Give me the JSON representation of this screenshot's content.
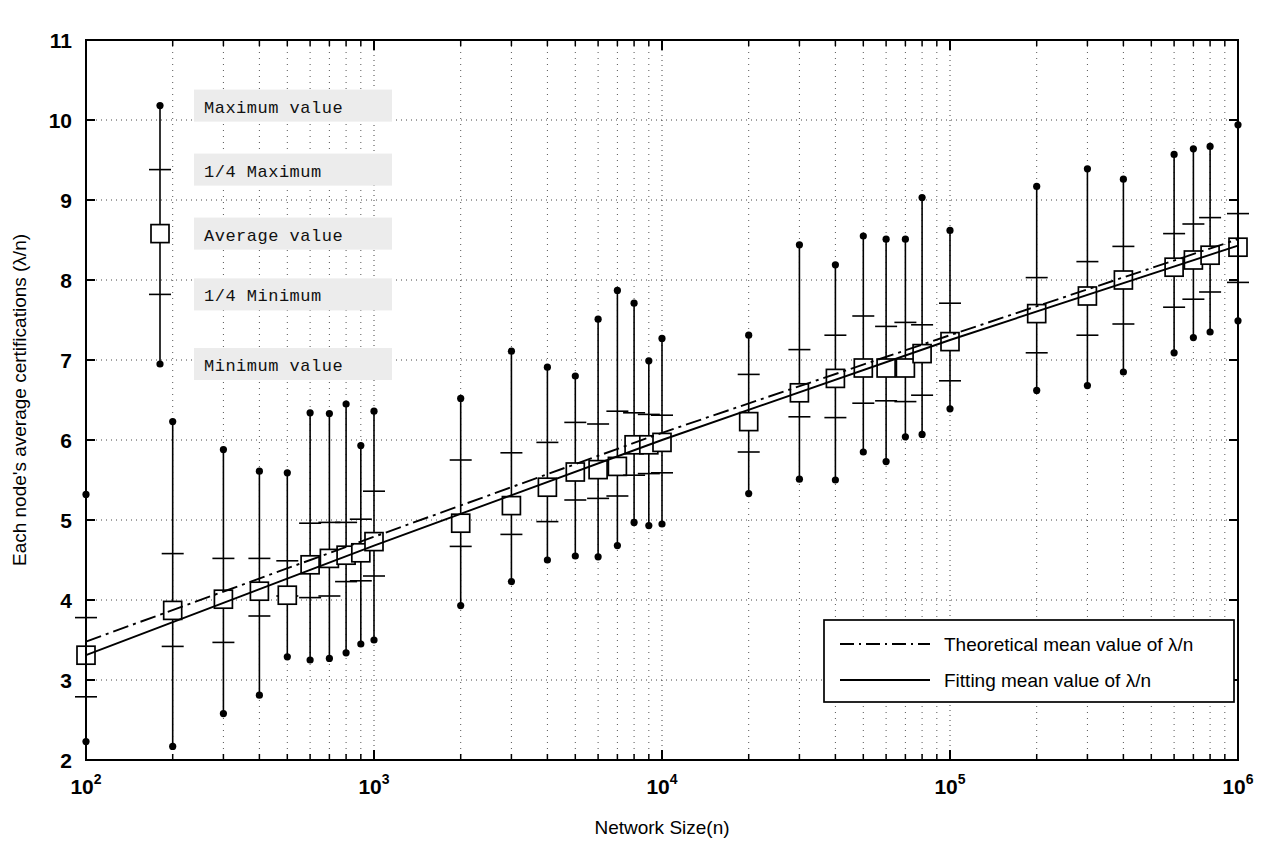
{
  "figure": {
    "title": "",
    "x_axis_label": "Network Size(n)",
    "y_axis_label": "Each node's average certifications (λ/n)"
  },
  "sample_legend": {
    "items": [
      {
        "key": "max",
        "label": "Maximum value",
        "marker": "filled-dot",
        "value": 10.18
      },
      {
        "key": "q3",
        "label": "1/4 Maximum",
        "marker": "tick",
        "value": 9.38
      },
      {
        "key": "avg",
        "label": "Average value",
        "marker": "open-square",
        "value": 8.58
      },
      {
        "key": "q1",
        "label": "1/4 Minimum",
        "marker": "tick",
        "value": 7.82
      },
      {
        "key": "min",
        "label": "Minimum value",
        "marker": "filled-dot",
        "value": 6.95
      }
    ]
  },
  "line_legend": {
    "items": [
      {
        "label": "Theoretical mean value of λ/n",
        "style": "dash-dot"
      },
      {
        "label": "Fitting mean value of λ/n",
        "style": "solid"
      }
    ]
  },
  "chart_data": {
    "type": "line",
    "subtype": "error-bars-with-fit",
    "title": "",
    "xlabel": "Network Size(n)",
    "ylabel": "Each node's average certifications (λ/n)",
    "xscale": "log",
    "yscale": "linear",
    "xlim": [
      100,
      1000000
    ],
    "ylim": [
      2,
      11
    ],
    "yticks": [
      2,
      3,
      4,
      5,
      6,
      7,
      8,
      9,
      10,
      11
    ],
    "xticks": [
      100,
      1000,
      10000,
      100000,
      1000000
    ],
    "xtick_labels": [
      "10^2",
      "10^3",
      "10^4",
      "10^5",
      "10^6"
    ],
    "grid": "dotted-both-axes",
    "legend_position": "lower-right",
    "series": [
      {
        "name": "Simulated distribution",
        "fields": [
          "n",
          "min",
          "q1",
          "avg",
          "q3",
          "max"
        ],
        "points": [
          {
            "n": 100,
            "min": 2.23,
            "q1": 2.79,
            "avg": 3.31,
            "q3": 3.78,
            "max": 5.32
          },
          {
            "n": 200,
            "min": 2.17,
            "q1": 3.42,
            "avg": 3.87,
            "q3": 4.58,
            "max": 6.23
          },
          {
            "n": 300,
            "min": 2.58,
            "q1": 3.47,
            "avg": 4.01,
            "q3": 4.52,
            "max": 5.88
          },
          {
            "n": 400,
            "min": 2.81,
            "q1": 3.8,
            "avg": 4.11,
            "q3": 4.52,
            "max": 5.61
          },
          {
            "n": 500,
            "min": 3.29,
            "q1": 4.05,
            "avg": 4.06,
            "q3": 4.49,
            "max": 5.59
          },
          {
            "n": 600,
            "min": 3.25,
            "q1": 4.03,
            "avg": 4.44,
            "q3": 4.96,
            "max": 6.34
          },
          {
            "n": 700,
            "min": 3.27,
            "q1": 4.05,
            "avg": 4.52,
            "q3": 4.97,
            "max": 6.33
          },
          {
            "n": 800,
            "min": 3.34,
            "q1": 4.23,
            "avg": 4.56,
            "q3": 4.97,
            "max": 6.45
          },
          {
            "n": 900,
            "min": 3.45,
            "q1": 4.24,
            "avg": 4.59,
            "q3": 5.01,
            "max": 5.93
          },
          {
            "n": 1000,
            "min": 3.5,
            "q1": 4.3,
            "avg": 4.73,
            "q3": 5.36,
            "max": 6.36
          },
          {
            "n": 2000,
            "min": 3.93,
            "q1": 4.67,
            "avg": 4.96,
            "q3": 5.75,
            "max": 6.52
          },
          {
            "n": 3000,
            "min": 4.23,
            "q1": 4.82,
            "avg": 5.18,
            "q3": 5.84,
            "max": 7.11
          },
          {
            "n": 4000,
            "min": 4.5,
            "q1": 4.98,
            "avg": 5.41,
            "q3": 5.97,
            "max": 6.91
          },
          {
            "n": 5000,
            "min": 4.55,
            "q1": 5.25,
            "avg": 5.6,
            "q3": 6.22,
            "max": 6.8
          },
          {
            "n": 6000,
            "min": 4.54,
            "q1": 5.27,
            "avg": 5.63,
            "q3": 6.2,
            "max": 7.51
          },
          {
            "n": 7000,
            "min": 4.68,
            "q1": 5.3,
            "avg": 5.67,
            "q3": 6.36,
            "max": 7.87
          },
          {
            "n": 8000,
            "min": 4.97,
            "q1": 5.56,
            "avg": 5.94,
            "q3": 6.34,
            "max": 7.71
          },
          {
            "n": 9000,
            "min": 4.93,
            "q1": 5.58,
            "avg": 5.94,
            "q3": 6.32,
            "max": 6.99
          },
          {
            "n": 10000,
            "min": 4.95,
            "q1": 5.59,
            "avg": 5.97,
            "q3": 6.31,
            "max": 7.27
          },
          {
            "n": 20000,
            "min": 5.33,
            "q1": 5.85,
            "avg": 6.23,
            "q3": 6.82,
            "max": 7.31
          },
          {
            "n": 30000,
            "min": 5.51,
            "q1": 6.29,
            "avg": 6.59,
            "q3": 7.13,
            "max": 8.44
          },
          {
            "n": 40000,
            "min": 5.5,
            "q1": 6.28,
            "avg": 6.77,
            "q3": 7.31,
            "max": 8.19
          },
          {
            "n": 50000,
            "min": 5.85,
            "q1": 6.46,
            "avg": 6.9,
            "q3": 7.55,
            "max": 8.55
          },
          {
            "n": 60000,
            "min": 5.73,
            "q1": 6.49,
            "avg": 6.9,
            "q3": 7.42,
            "max": 8.51
          },
          {
            "n": 70000,
            "min": 6.04,
            "q1": 6.48,
            "avg": 6.9,
            "q3": 7.47,
            "max": 8.51
          },
          {
            "n": 80000,
            "min": 6.07,
            "q1": 6.56,
            "avg": 7.08,
            "q3": 7.44,
            "max": 9.03
          },
          {
            "n": 100000,
            "min": 6.39,
            "q1": 6.74,
            "avg": 7.23,
            "q3": 7.71,
            "max": 8.62
          },
          {
            "n": 200000,
            "min": 6.62,
            "q1": 7.09,
            "avg": 7.58,
            "q3": 8.03,
            "max": 9.17
          },
          {
            "n": 300000,
            "min": 6.68,
            "q1": 7.31,
            "avg": 7.8,
            "q3": 8.23,
            "max": 9.39
          },
          {
            "n": 400000,
            "min": 6.85,
            "q1": 7.45,
            "avg": 8.0,
            "q3": 8.42,
            "max": 9.26
          },
          {
            "n": 600000,
            "min": 7.09,
            "q1": 7.66,
            "avg": 8.16,
            "q3": 8.58,
            "max": 9.57
          },
          {
            "n": 700000,
            "min": 7.28,
            "q1": 7.76,
            "avg": 8.25,
            "q3": 8.7,
            "max": 9.64
          },
          {
            "n": 800000,
            "min": 7.35,
            "q1": 7.85,
            "avg": 8.31,
            "q3": 8.78,
            "max": 9.67
          },
          {
            "n": 1000000,
            "min": 7.49,
            "q1": 7.97,
            "avg": 8.41,
            "q3": 8.83,
            "max": 9.94
          }
        ]
      },
      {
        "name": "Theoretical mean value of λ/n",
        "style": "dash-dot",
        "x": [
          100,
          1000,
          10000,
          100000,
          1000000
        ],
        "y": [
          3.48,
          4.79,
          6.09,
          7.31,
          8.51
        ]
      },
      {
        "name": "Fitting mean value of λ/n",
        "style": "solid",
        "x": [
          100,
          1000,
          10000,
          100000,
          1000000
        ],
        "y": [
          3.31,
          4.68,
          6.0,
          7.25,
          8.43
        ]
      }
    ]
  }
}
